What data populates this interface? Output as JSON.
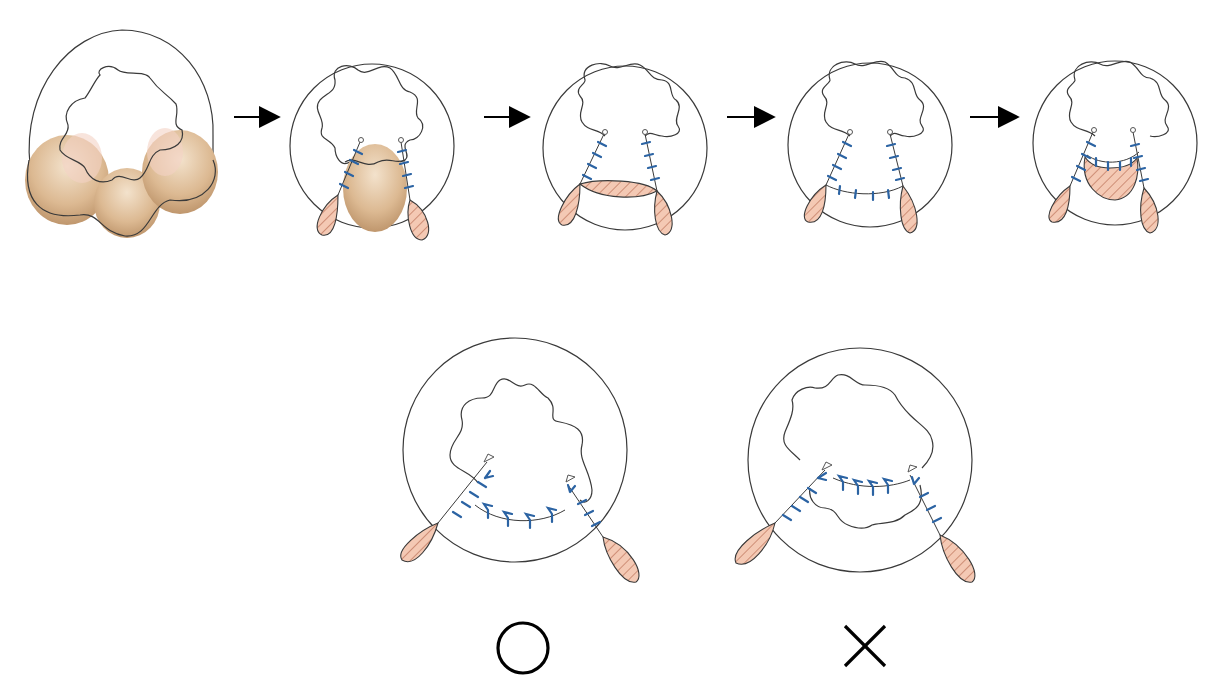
{
  "figure": {
    "colors": {
      "outline": "#3a3a3a",
      "suture": "#2b63a3",
      "flap_fill": "#f4c9b4",
      "flap_hatch": "#b5664c",
      "tissue_fill": "#d9b48a",
      "arrow": "#000000"
    },
    "steps": [
      {
        "id": 1,
        "name": "initial-state-prolapse"
      },
      {
        "id": 2,
        "name": "incisions-sutured-central-tissue"
      },
      {
        "id": 3,
        "name": "central-flap-excision"
      },
      {
        "id": 4,
        "name": "bridge-sutured"
      },
      {
        "id": 5,
        "name": "central-tissue-invaginated"
      }
    ],
    "arrows": [
      "→",
      "→",
      "→",
      "→"
    ],
    "comparison": [
      {
        "name": "correct",
        "symbol": "○",
        "meaning": "correct"
      },
      {
        "name": "incorrect",
        "symbol": "×",
        "meaning": "incorrect"
      }
    ]
  }
}
